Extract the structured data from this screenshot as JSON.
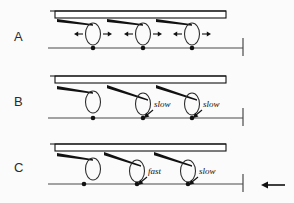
{
  "figure": {
    "background_color": "#fbfbfb",
    "ink_color": "#111111",
    "panels": [
      {
        "letter": "A",
        "letter_x": 14,
        "letter_y": 41,
        "bar": {
          "x": 55,
          "y": 11,
          "width": 171,
          "height": 7
        },
        "baseline": {
          "x1": 48,
          "y1": 48,
          "x2": 243,
          "y2": 48
        },
        "end_tick": {
          "x": 243,
          "y1": 38,
          "y2": 56
        },
        "cells": [
          {
            "cx": 93,
            "cy": 34,
            "rx": 7.5,
            "ry": 11
          },
          {
            "cx": 143,
            "cy": 34,
            "rx": 7.5,
            "ry": 11
          },
          {
            "cx": 192,
            "cy": 34,
            "rx": 7.5,
            "ry": 11
          }
        ],
        "dots": [
          {
            "cx": 93,
            "cy": 48
          },
          {
            "cx": 143,
            "cy": 48
          },
          {
            "cx": 192,
            "cy": 48
          }
        ],
        "tails": [
          {
            "x1": 57,
            "y1": 19,
            "x2": 93,
            "y2": 25,
            "thickness": 3.0
          },
          {
            "x1": 107,
            "y1": 19,
            "x2": 143,
            "y2": 25,
            "thickness": 3.0
          },
          {
            "x1": 156,
            "y1": 19,
            "x2": 192,
            "y2": 25,
            "thickness": 3.0
          }
        ],
        "dash_arrows": [
          {
            "cx": 93,
            "cy": 34,
            "direction": "left"
          },
          {
            "cx": 93,
            "cy": 34,
            "direction": "right"
          },
          {
            "cx": 143,
            "cy": 34,
            "direction": "left"
          },
          {
            "cx": 143,
            "cy": 34,
            "direction": "right"
          },
          {
            "cx": 192,
            "cy": 34,
            "direction": "left"
          },
          {
            "cx": 192,
            "cy": 34,
            "direction": "right"
          }
        ],
        "labels": []
      },
      {
        "letter": "B",
        "letter_x": 14,
        "letter_y": 106,
        "bar": {
          "x": 55,
          "y": 76,
          "width": 171,
          "height": 7
        },
        "baseline": {
          "x1": 48,
          "y1": 118,
          "x2": 243,
          "y2": 118
        },
        "end_tick": {
          "x": 243,
          "y1": 108,
          "y2": 126
        },
        "cells": [
          {
            "cx": 93,
            "cy": 102,
            "rx": 7.5,
            "ry": 11
          },
          {
            "cx": 143,
            "cy": 104,
            "rx": 7.5,
            "ry": 11
          },
          {
            "cx": 192,
            "cy": 104,
            "rx": 7.5,
            "ry": 11
          }
        ],
        "dots": [
          {
            "cx": 93,
            "cy": 118
          },
          {
            "cx": 143,
            "cy": 118
          },
          {
            "cx": 192,
            "cy": 118
          }
        ],
        "tails": [
          {
            "x1": 57,
            "y1": 86,
            "x2": 93,
            "y2": 93,
            "thickness": 3.2
          },
          {
            "x1": 107,
            "y1": 85,
            "x2": 148,
            "y2": 100,
            "thickness": 3.2
          },
          {
            "x1": 156,
            "y1": 85,
            "x2": 197,
            "y2": 100,
            "thickness": 3.2
          }
        ],
        "dash_arrows": [],
        "labels": [
          {
            "text": "slow",
            "x": 154,
            "y": 107,
            "leader": {
              "x1": 153,
              "y1": 110,
              "x2": 144,
              "y2": 118
            }
          },
          {
            "text": "slow",
            "x": 203,
            "y": 107,
            "leader": {
              "x1": 202,
              "y1": 110,
              "x2": 193,
              "y2": 118
            }
          }
        ]
      },
      {
        "letter": "C",
        "letter_x": 14,
        "letter_y": 172,
        "bar": {
          "x": 55,
          "y": 144,
          "width": 171,
          "height": 7
        },
        "baseline": {
          "x1": 48,
          "y1": 184,
          "x2": 243,
          "y2": 184
        },
        "end_tick": {
          "x": 243,
          "y1": 174,
          "y2": 192
        },
        "cells": [
          {
            "cx": 93,
            "cy": 169,
            "rx": 7.5,
            "ry": 11
          },
          {
            "cx": 137,
            "cy": 171,
            "rx": 7.5,
            "ry": 11
          },
          {
            "cx": 188,
            "cy": 171,
            "rx": 7.5,
            "ry": 11
          }
        ],
        "dots": [
          {
            "cx": 84,
            "cy": 184
          },
          {
            "cx": 137,
            "cy": 184
          },
          {
            "cx": 188,
            "cy": 184
          }
        ],
        "tails": [
          {
            "x1": 57,
            "y1": 153,
            "x2": 93,
            "y2": 160,
            "thickness": 3.2
          },
          {
            "x1": 104,
            "y1": 152,
            "x2": 141,
            "y2": 166,
            "thickness": 3.2
          },
          {
            "x1": 154,
            "y1": 152,
            "x2": 192,
            "y2": 166,
            "thickness": 3.2
          }
        ],
        "dash_arrows": [],
        "labels": [
          {
            "text": "fast",
            "x": 148,
            "y": 174,
            "leader": {
              "x1": 147,
              "y1": 177,
              "x2": 138,
              "y2": 185
            }
          },
          {
            "text": "slow",
            "x": 199,
            "y": 174,
            "leader": {
              "x1": 198,
              "y1": 177,
              "x2": 189,
              "y2": 185
            }
          }
        ]
      }
    ],
    "direction_arrow": {
      "name": "leftward-direction-arrow",
      "x1": 285,
      "x2": 261,
      "y": 185,
      "direction": "left"
    }
  }
}
